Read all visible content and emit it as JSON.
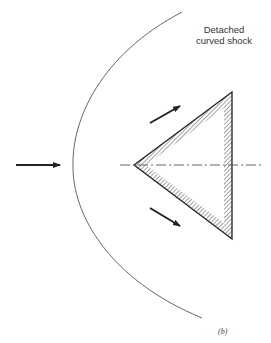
{
  "figure": {
    "shock_label_line1": "Detached",
    "shock_label_line2": "curved shock",
    "caption": "(b)"
  },
  "diagram": {
    "elements": [
      {
        "type": "curve",
        "name": "detached-curved-shock",
        "path_points": [
          [
            180,
            12
          ],
          [
            73,
            165
          ],
          [
            200,
            318
          ]
        ]
      },
      {
        "type": "wedge",
        "name": "wedge-body",
        "vertices": [
          [
            134,
            165
          ],
          [
            232,
            92
          ],
          [
            232,
            239
          ]
        ],
        "hatched_edges": true
      },
      {
        "type": "axis",
        "name": "centerline",
        "style": "dash-dot",
        "from": [
          120,
          165
        ],
        "to": [
          262,
          165
        ]
      },
      {
        "type": "arrow",
        "name": "freestream-flow-arrow",
        "from": [
          16,
          165
        ],
        "to": [
          60,
          165
        ]
      },
      {
        "type": "arrow",
        "name": "upper-flow-arrow",
        "from": [
          150,
          123
        ],
        "to": [
          180,
          106
        ]
      },
      {
        "type": "arrow",
        "name": "lower-flow-arrow",
        "from": [
          150,
          208
        ],
        "to": [
          180,
          225
        ]
      }
    ],
    "colors": {
      "line": "#333333",
      "hatch": "#444444",
      "background": "#ffffff"
    }
  }
}
